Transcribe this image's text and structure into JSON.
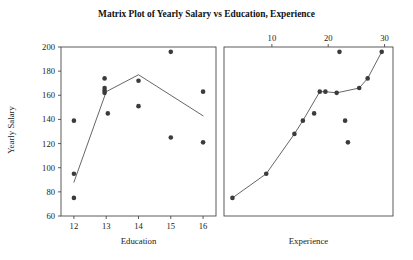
{
  "chart_data": {
    "type": "scatter",
    "title": "Matrix Plot of Yearly Salary vs Education, Experience",
    "ylabel": "Yearly Salary",
    "ylim": [
      60,
      200
    ],
    "yticks": [
      60,
      80,
      100,
      120,
      140,
      160,
      180,
      200
    ],
    "grid": false,
    "legend": null,
    "panels": [
      {
        "name": "education-panel",
        "xlabel": "Education",
        "xlabel_position": "bottom",
        "xticks": [
          12,
          13,
          14,
          15,
          16
        ],
        "xlim": [
          11.6,
          16.4
        ],
        "points": [
          {
            "x": 12,
            "y": 139
          },
          {
            "x": 12,
            "y": 95
          },
          {
            "x": 12,
            "y": 75
          },
          {
            "x": 12.95,
            "y": 174
          },
          {
            "x": 12.95,
            "y": 166
          },
          {
            "x": 12.95,
            "y": 164
          },
          {
            "x": 12.95,
            "y": 162
          },
          {
            "x": 13.05,
            "y": 145
          },
          {
            "x": 14,
            "y": 172
          },
          {
            "x": 14,
            "y": 151
          },
          {
            "x": 15,
            "y": 196
          },
          {
            "x": 15,
            "y": 125
          },
          {
            "x": 16,
            "y": 163
          },
          {
            "x": 16,
            "y": 121
          }
        ],
        "line": [
          {
            "x": 12,
            "y": 88
          },
          {
            "x": 13,
            "y": 163
          },
          {
            "x": 14,
            "y": 177
          },
          {
            "x": 16,
            "y": 143
          }
        ]
      },
      {
        "name": "experience-panel",
        "xlabel": "Experience",
        "xlabel_position": "bottom",
        "xticks": [
          10,
          20,
          30
        ],
        "xlim": [
          1.5,
          31.5
        ],
        "points": [
          {
            "x": 3,
            "y": 75
          },
          {
            "x": 9,
            "y": 95
          },
          {
            "x": 14,
            "y": 128
          },
          {
            "x": 15.5,
            "y": 139
          },
          {
            "x": 17.5,
            "y": 145
          },
          {
            "x": 18.5,
            "y": 163
          },
          {
            "x": 19.5,
            "y": 163
          },
          {
            "x": 21.5,
            "y": 162
          },
          {
            "x": 22,
            "y": 196
          },
          {
            "x": 23,
            "y": 139
          },
          {
            "x": 23.5,
            "y": 121
          },
          {
            "x": 25.5,
            "y": 166
          },
          {
            "x": 27,
            "y": 174
          },
          {
            "x": 29.5,
            "y": 196
          }
        ],
        "line": [
          {
            "x": 3,
            "y": 75
          },
          {
            "x": 9,
            "y": 95
          },
          {
            "x": 14,
            "y": 128
          },
          {
            "x": 15.5,
            "y": 139
          },
          {
            "x": 18.5,
            "y": 163
          },
          {
            "x": 19.5,
            "y": 163
          },
          {
            "x": 21.5,
            "y": 162
          },
          {
            "x": 25.5,
            "y": 166
          },
          {
            "x": 27,
            "y": 174
          },
          {
            "x": 29.5,
            "y": 196
          }
        ]
      }
    ]
  }
}
